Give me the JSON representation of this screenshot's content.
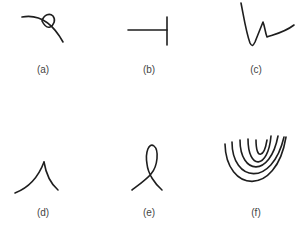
{
  "figure": {
    "panels": [
      {
        "id": "a",
        "label": "(a)",
        "description": "arc with small loop (curl) on top"
      },
      {
        "id": "b",
        "label": "(b)",
        "description": "horizontal line ending at vertical bar (T-junction)"
      },
      {
        "id": "c",
        "label": "(c)",
        "description": "zigzag stroke (sharp V then curve)"
      },
      {
        "id": "d",
        "label": "(d)",
        "description": "cusp (two curves meeting at a point)"
      },
      {
        "id": "e",
        "label": "(e)",
        "description": "self-intersecting loop"
      },
      {
        "id": "f",
        "label": "(f)",
        "description": "nested U-shaped curves (concentric arcs)"
      }
    ],
    "stroke_color": "#1e1e1e",
    "label_color": "#444444"
  }
}
